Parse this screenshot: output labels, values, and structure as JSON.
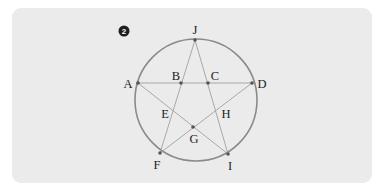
{
  "figure": {
    "badge": "2",
    "circle": {
      "cx": 196,
      "cy": 100,
      "r": 61,
      "stroke": "#8a8a8a"
    },
    "colors": {
      "panel_bg": "#ebebeb",
      "circle_stroke": "#8a8a8a",
      "line_stroke": "#a0a0a0",
      "point_fill": "#555555",
      "label_color": "#222222",
      "badge_fill": "#1e1e1e"
    },
    "points": {
      "J": {
        "x": 195,
        "y": 40
      },
      "A": {
        "x": 138,
        "y": 83
      },
      "B": {
        "x": 181,
        "y": 83
      },
      "C": {
        "x": 208,
        "y": 83
      },
      "D": {
        "x": 252,
        "y": 83
      },
      "E": {
        "x": 168,
        "y": 110
      },
      "H": {
        "x": 221,
        "y": 110
      },
      "G": {
        "x": 193,
        "y": 127
      },
      "F": {
        "x": 160,
        "y": 153
      },
      "I": {
        "x": 228,
        "y": 154
      }
    },
    "segments": [
      [
        "J",
        "F"
      ],
      [
        "J",
        "I"
      ],
      [
        "A",
        "D"
      ],
      [
        "A",
        "I"
      ],
      [
        "D",
        "F"
      ]
    ],
    "labels": {
      "J": "J",
      "A": "A",
      "B": "B",
      "C": "C",
      "D": "D",
      "E": "E",
      "H": "H",
      "G": "G",
      "F": "F",
      "I": "I"
    }
  }
}
